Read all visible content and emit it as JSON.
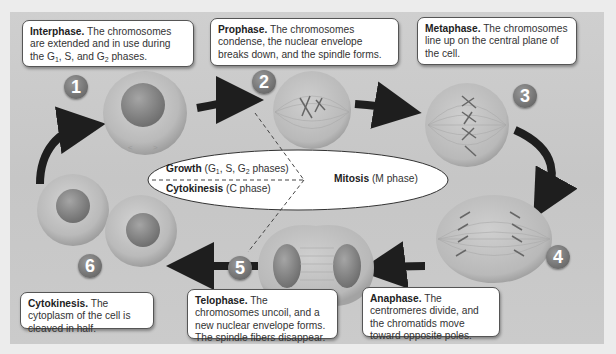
{
  "diagram": {
    "colors": {
      "page_bg": "#ececec",
      "panel_bg": "#c9c9c9",
      "callout_bg": "#ffffff",
      "badge": "#6e6e6e",
      "arrow": "#1e1e1e",
      "cell_outer": "#bdbdbd",
      "nucleus": "#8e8e8e"
    },
    "callouts": [
      {
        "id": "interphase",
        "title": "Interphase.",
        "text_before": "The chromosomes are extended and in use during the G",
        "sub1": "1",
        "mid": ", S, and G",
        "sub2": "2",
        "text_after": " phases."
      },
      {
        "id": "prophase",
        "title": "Prophase.",
        "text": "The chromosomes condense, the nuclear envelope breaks down, and the spindle forms."
      },
      {
        "id": "metaphase",
        "title": "Metaphase.",
        "text": "The chromosomes line up on the central plane of the cell."
      },
      {
        "id": "cytokinesis",
        "title": "Cytokinesis.",
        "text": "The cytoplasm of the cell is cleaved in half."
      },
      {
        "id": "telophase",
        "title": "Telophase.",
        "text": "The chromosomes uncoil, and a new nuclear envelope forms. The spindle fibers disappear."
      },
      {
        "id": "anaphase",
        "title": "Anaphase.",
        "text": "The centromeres divide, and the chromatids move toward opposite poles."
      }
    ],
    "steps": [
      "1",
      "2",
      "3",
      "4",
      "5",
      "6"
    ],
    "center": {
      "growth_label": "Growth",
      "growth_detail_pre": "(G",
      "growth_sub1": "1",
      "growth_detail_mid": ", S, G",
      "growth_sub2": "2",
      "growth_detail_post": " phases)",
      "cytokinesis_label": "Cytokinesis",
      "cytokinesis_detail": "(C phase)",
      "mitosis_label": "Mitosis",
      "mitosis_detail": "(M phase)"
    }
  }
}
